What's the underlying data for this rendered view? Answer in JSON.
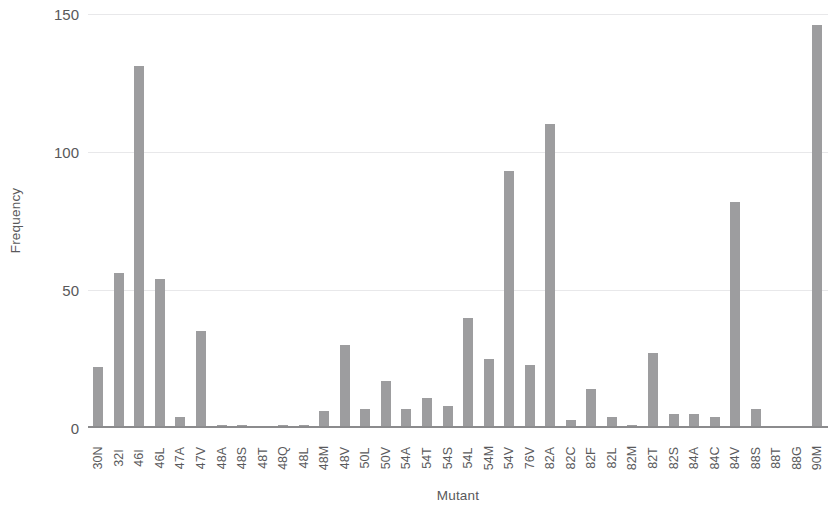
{
  "chart_data": {
    "type": "bar",
    "title": "",
    "xlabel": "Mutant",
    "ylabel": "Frequency",
    "ylim": [
      0,
      150
    ],
    "yticks": [
      0,
      50,
      100,
      150
    ],
    "ytick_labels": [
      "0",
      "50",
      "100",
      "150"
    ],
    "grid": true,
    "grid_axis": "y",
    "legend": false,
    "bar_color": "#9d9d9f",
    "axis_color": "#8b8b8d",
    "grid_color": "#e8e8ea",
    "text_color": "#59595b",
    "xtick_rotation": 90,
    "categories": [
      "30N",
      "32I",
      "46I",
      "46L",
      "47A",
      "47V",
      "48A",
      "48S",
      "48T",
      "48Q",
      "48L",
      "48M",
      "48V",
      "50L",
      "50V",
      "54A",
      "54T",
      "54S",
      "54L",
      "54M",
      "54V",
      "76V",
      "82A",
      "82C",
      "82F",
      "82L",
      "82M",
      "82T",
      "82S",
      "84A",
      "84C",
      "84V",
      "88S",
      "88T",
      "88G",
      "90M"
    ],
    "values": [
      22,
      56,
      131,
      54,
      4,
      35,
      1,
      1,
      0,
      1,
      1,
      6,
      30,
      7,
      17,
      7,
      11,
      8,
      40,
      25,
      93,
      23,
      110,
      3,
      14,
      4,
      1,
      27,
      5,
      5,
      4,
      82,
      7,
      0,
      0,
      146
    ]
  }
}
